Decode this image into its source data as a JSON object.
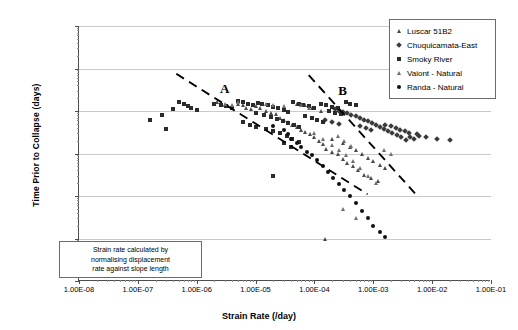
{
  "chart_data": {
    "type": "scatter",
    "title": "",
    "xlabel": "Strain Rate (/day)",
    "ylabel": "Time Prior to Collapse (days)",
    "xscale": "log",
    "yscale": "log",
    "xlim": [
      1e-08,
      0.1
    ],
    "ylim": [
      0.01,
      10000
    ],
    "grid": true,
    "legend_position": "top-right",
    "xticklabels": [
      "1.00E-08",
      "1.00E-07",
      "1.00E-06",
      "1.00E-05",
      "1.00E-04",
      "1.00E-03",
      "1.00E-02",
      "1.00E-01"
    ],
    "yticklabels": [
      "10000.00",
      "1000.00",
      "100.00",
      "10.00",
      "1.00",
      "0.10",
      "0.01"
    ],
    "series": [
      {
        "name": "Luscar 51B2",
        "marker": "triangle",
        "color": "#6e6e6e",
        "points": [
          [
            2.2e-06,
            160
          ],
          [
            2.6e-06,
            150
          ],
          [
            3e-06,
            140
          ],
          [
            3.4e-06,
            130
          ],
          [
            4e-06,
            120
          ],
          [
            5e-06,
            150
          ],
          [
            6e-06,
            140
          ],
          [
            7e-06,
            120
          ],
          [
            8.5e-06,
            110
          ],
          [
            1e-05,
            130
          ],
          [
            1.2e-05,
            115
          ],
          [
            1.5e-05,
            100
          ],
          [
            1.8e-05,
            92
          ],
          [
            2.2e-05,
            85
          ],
          [
            2.6e-05,
            70
          ],
          [
            3e-05,
            62
          ],
          [
            3.6e-05,
            55
          ],
          [
            4.2e-05,
            48
          ],
          [
            5e-05,
            42
          ],
          [
            6e-05,
            36
          ],
          [
            7e-05,
            32
          ],
          [
            8.5e-05,
            28
          ],
          [
            0.0001,
            24
          ],
          [
            0.00012,
            20
          ],
          [
            0.00014,
            17
          ],
          [
            5e-05,
            150
          ],
          [
            7e-05,
            140
          ],
          [
            9e-05,
            120
          ],
          [
            0.00013,
            100
          ],
          [
            0.00016,
            13
          ],
          [
            0.0002,
            11
          ],
          [
            0.00025,
            9.5
          ],
          [
            0.0003,
            7.5
          ],
          [
            0.00036,
            6.0
          ],
          [
            0.00045,
            5.0
          ],
          [
            0.00055,
            4.0
          ],
          [
            0.0007,
            3.2
          ],
          [
            0.0009,
            2.6
          ],
          [
            0.0012,
            2.2
          ],
          [
            0.0002,
            22
          ],
          [
            0.0003,
            18
          ],
          [
            0.0004,
            14
          ],
          [
            0.0005,
            12
          ],
          [
            0.00065,
            10
          ],
          [
            0.0008,
            8.0
          ],
          [
            0.001,
            6.5
          ],
          [
            0.0013,
            5.5
          ],
          [
            0.0016,
            4.5
          ],
          [
            0.00015,
            0.1
          ]
        ]
      },
      {
        "name": "Chuquicamata-East",
        "marker": "diamond",
        "color": "#3a3a3a",
        "points": [
          [
            0.0003,
            95
          ],
          [
            0.00036,
            90
          ],
          [
            0.00042,
            82
          ],
          [
            0.0005,
            75
          ],
          [
            0.0006,
            70
          ],
          [
            0.0007,
            62
          ],
          [
            0.0008,
            58
          ],
          [
            0.00095,
            52
          ],
          [
            0.0011,
            46
          ],
          [
            0.0013,
            42
          ],
          [
            0.0015,
            38
          ],
          [
            0.0018,
            34
          ],
          [
            0.0021,
            30
          ],
          [
            0.0025,
            27
          ],
          [
            0.003,
            24
          ],
          [
            0.0036,
            21
          ],
          [
            0.0042,
            25
          ],
          [
            0.005,
            22
          ],
          [
            0.006,
            26
          ],
          [
            0.008,
            24
          ],
          [
            0.012,
            22
          ],
          [
            0.02,
            21
          ],
          [
            0.00022,
            110
          ],
          [
            0.00026,
            100
          ],
          [
            0.0016,
            48
          ],
          [
            0.002,
            44
          ],
          [
            0.0024,
            40
          ],
          [
            0.0028,
            36
          ],
          [
            0.0034,
            33
          ],
          [
            0.004,
            30
          ],
          [
            0.0055,
            28
          ],
          [
            0.00015,
            60
          ],
          [
            0.0002,
            55
          ],
          [
            0.00026,
            50
          ],
          [
            0.0006,
            45
          ],
          [
            0.00075,
            40
          ],
          [
            0.0009,
            36
          ]
        ]
      },
      {
        "name": "Smoky River",
        "marker": "square",
        "color": "#2b2b2b",
        "points": [
          [
            1.6e-07,
            60
          ],
          [
            2.6e-07,
            80
          ],
          [
            3e-07,
            38
          ],
          [
            4e-07,
            110
          ],
          [
            5e-07,
            160
          ],
          [
            6e-07,
            150
          ],
          [
            7e-07,
            130
          ],
          [
            8e-07,
            115
          ],
          [
            1e-06,
            105
          ],
          [
            2e-06,
            150
          ],
          [
            2.6e-06,
            140
          ],
          [
            3.2e-06,
            130
          ],
          [
            4e-06,
            120
          ],
          [
            5e-06,
            170
          ],
          [
            6e-06,
            160
          ],
          [
            7.5e-06,
            150
          ],
          [
            9e-06,
            140
          ],
          [
            1.1e-05,
            155
          ],
          [
            1.3e-05,
            145
          ],
          [
            1.6e-05,
            135
          ],
          [
            2e-05,
            125
          ],
          [
            2.4e-05,
            115
          ],
          [
            3e-05,
            105
          ],
          [
            3.6e-05,
            95
          ],
          [
            4.4e-05,
            160
          ],
          [
            5.5e-05,
            150
          ],
          [
            6.5e-05,
            140
          ],
          [
            8e-05,
            130
          ],
          [
            0.0001,
            120
          ],
          [
            0.00013,
            145
          ],
          [
            0.00016,
            135
          ],
          [
            0.0002,
            125
          ],
          [
            0.00025,
            115
          ],
          [
            1e-05,
            90
          ],
          [
            1.4e-05,
            80
          ],
          [
            1.8e-05,
            72
          ],
          [
            2.3e-05,
            65
          ],
          [
            2.9e-05,
            58
          ],
          [
            3.5e-05,
            52
          ],
          [
            4.5e-05,
            46
          ],
          [
            5.5e-05,
            42
          ],
          [
            7e-05,
            75
          ],
          [
            9e-05,
            68
          ],
          [
            0.00011,
            60
          ],
          [
            0.00014,
            55
          ],
          [
            6e-06,
            55
          ],
          [
            8e-06,
            48
          ],
          [
            1e-05,
            42
          ],
          [
            1.5e-05,
            38
          ],
          [
            2e-05,
            34
          ],
          [
            2.6e-05,
            30
          ],
          [
            3.4e-05,
            26
          ],
          [
            4.2e-05,
            22
          ],
          [
            5.5e-05,
            19
          ],
          [
            3e-05,
            18
          ],
          [
            4e-05,
            14
          ],
          [
            2e-05,
            3.0
          ],
          [
            0.00018,
            100
          ],
          [
            0.00022,
            92
          ],
          [
            0.00028,
            85
          ],
          [
            0.00034,
            160
          ],
          [
            0.0004,
            150
          ],
          [
            0.0005,
            140
          ]
        ]
      },
      {
        "name": "Vaiont - Natural",
        "marker": "triangle-light",
        "color": "#8f8f8f",
        "points": [
          [
            3e-06,
            150
          ],
          [
            4e-06,
            140
          ],
          [
            5e-06,
            160
          ],
          [
            1.5e-05,
            150
          ],
          [
            2e-05,
            140
          ],
          [
            3e-05,
            130
          ],
          [
            6e-05,
            140
          ],
          [
            8e-05,
            120
          ],
          [
            0.0001,
            30
          ],
          [
            0.00014,
            22
          ],
          [
            0.0002,
            16
          ],
          [
            0.00026,
            12
          ],
          [
            0.00034,
            9.0
          ],
          [
            0.00045,
            6.5
          ],
          [
            0.0006,
            4.5
          ],
          [
            0.0008,
            3.0
          ],
          [
            0.0011,
            2.0
          ],
          [
            0.0015,
            12
          ],
          [
            0.002,
            10
          ],
          [
            0.00025,
            26
          ],
          [
            0.00032,
            20
          ],
          [
            0.00042,
            15
          ],
          [
            0.0005,
            0.3
          ],
          [
            0.0003,
            0.5
          ]
        ]
      },
      {
        "name": "Randa - Natural",
        "marker": "circle",
        "color": "#111111",
        "points": [
          [
            4e-05,
            22
          ],
          [
            5e-05,
            18
          ],
          [
            6e-05,
            14
          ],
          [
            7.5e-05,
            11
          ],
          [
            9e-05,
            9.0
          ],
          [
            0.00011,
            7.0
          ],
          [
            0.00014,
            5.0
          ],
          [
            0.00017,
            3.6
          ],
          [
            0.00021,
            2.6
          ],
          [
            0.00026,
            1.9
          ],
          [
            0.00032,
            1.4
          ],
          [
            0.0004,
            1.0
          ],
          [
            0.0005,
            0.7
          ],
          [
            0.00065,
            0.45
          ],
          [
            0.0008,
            0.3
          ],
          [
            0.001,
            0.2
          ],
          [
            0.0013,
            0.14
          ],
          [
            0.0016,
            0.11
          ],
          [
            3e-05,
            35
          ],
          [
            3.5e-05,
            28
          ],
          [
            2e-05,
            45
          ]
        ]
      }
    ],
    "trendlines": [
      {
        "label": "A",
        "x0": 4.5e-07,
        "y0": 750,
        "x1": 0.0008,
        "y1": 1.1
      },
      {
        "label": "B",
        "x0": 8e-05,
        "y0": 700,
        "x1": 0.006,
        "y1": 0.9
      }
    ],
    "annotations": [
      {
        "name": "trend-label-a",
        "text": "A",
        "x": 3e-06,
        "y": 330
      },
      {
        "name": "trend-label-b",
        "text": "B",
        "x": 0.0003,
        "y": 300
      }
    ]
  },
  "axes": {
    "y_title": "Time Prior to Collapse (days)",
    "x_title": "Strain Rate (/day)",
    "y_ticks": [
      "10000.00",
      "1000.00",
      "100.00",
      "10.00",
      "1.00",
      "0.10",
      "0.01"
    ],
    "x_ticks": [
      "1.00E-08",
      "1.00E-07",
      "1.00E-06",
      "1.00E-05",
      "1.00E-04",
      "1.00E-03",
      "1.00E-02",
      "1.00E-01"
    ]
  },
  "legend": {
    "items": [
      {
        "label": "Luscar 51B2",
        "marker": "triangle"
      },
      {
        "label": "Chuquicamata-East",
        "marker": "diamond"
      },
      {
        "label": "Smoky River",
        "marker": "square"
      },
      {
        "label": "Vaiont - Natural",
        "marker": "triangle-light"
      },
      {
        "label": "Randa - Natural",
        "marker": "circle"
      }
    ]
  },
  "note": {
    "line1": "Strain rate calculated by",
    "line2": "normalising displacement",
    "line3": "rate against slope length"
  }
}
